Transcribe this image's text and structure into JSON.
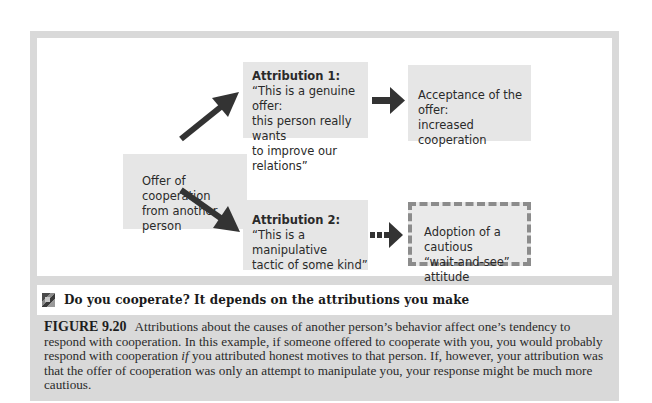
{
  "diagram": {
    "origin": {
      "text": "Offer of cooperation from another person",
      "line1": "Offer of cooperation",
      "line2": "from another person"
    },
    "attribution1": {
      "title": "Attribution 1:",
      "line1": "“This is a genuine offer:",
      "line2": "this person really wants",
      "line3": "to improve our relations”"
    },
    "outcome1": {
      "line1": "Acceptance of the offer:",
      "line2": "increased cooperation"
    },
    "attribution2": {
      "title": "Attribution 2:",
      "line1": "“This is a manipulative",
      "line2": "tactic of some kind”"
    },
    "outcome2": {
      "line1": "Adoption of a cautious",
      "line2": "“wait-and-see” attitude"
    },
    "arrows": [
      {
        "from": "origin",
        "to": "attribution1",
        "style": "solid"
      },
      {
        "from": "origin",
        "to": "attribution2",
        "style": "solid"
      },
      {
        "from": "attribution1",
        "to": "outcome1",
        "style": "solid"
      },
      {
        "from": "attribution2",
        "to": "outcome2",
        "style": "dashed"
      }
    ],
    "colors": {
      "frame": "#d9d9d9",
      "box": "#e6e6e6",
      "arrow": "#333333",
      "dashed_border": "#8c8c8c"
    }
  },
  "title_bar": {
    "icon": "puzzle-icon",
    "text": "Do you cooperate? It depends on the attributions you make"
  },
  "caption": {
    "label": "FIGURE 9.20",
    "text_before_italic": "Attributions about the causes of another person’s behavior affect one’s tendency to respond with cooperation. In this example, if someone offered to cooperate with you, you would probably respond with cooperation ",
    "italic": "if",
    "text_after_italic": " you attributed honest motives to that person. If, however, your attribution was that the offer of cooperation was only an attempt to manipulate you, your response might be much more cautious."
  }
}
